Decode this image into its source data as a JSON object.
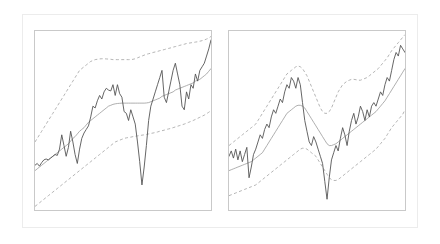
{
  "figure": {
    "background_color": "#ffffff",
    "frame_color": "#ececec",
    "panel_border_color": "#c9c9c9",
    "panel_count": 2
  },
  "colors": {
    "price_line": "#555555",
    "middle_band": "#9a9a9a",
    "outer_bands": "#a8a8a8"
  },
  "chart_data": [
    {
      "type": "line",
      "title": "",
      "subtitle": "",
      "xlabel": "",
      "ylabel": "",
      "xlim": [
        0,
        100
      ],
      "ylim": [
        0,
        100
      ],
      "grid": false,
      "legend": "none",
      "annotations": [],
      "xtick_labels": [],
      "ytick_labels": [],
      "panel_index": 0,
      "panel_name": "left-panel",
      "x": [
        0,
        1.27,
        2.53,
        3.8,
        5.06,
        6.33,
        7.59,
        8.86,
        10.13,
        11.39,
        12.66,
        13.92,
        15.19,
        16.46,
        17.72,
        18.99,
        20.25,
        21.52,
        22.78,
        24.05,
        25.32,
        26.58,
        27.85,
        29.11,
        30.38,
        31.65,
        32.91,
        34.18,
        35.44,
        36.71,
        37.97,
        39.24,
        40.51,
        41.77,
        43.04,
        44.3,
        45.57,
        46.84,
        48.1,
        49.37,
        50.63,
        51.9,
        53.16,
        54.43,
        55.7,
        56.96,
        58.23,
        59.49,
        60.76,
        62.03,
        63.29,
        64.56,
        65.82,
        67.09,
        68.35,
        69.62,
        70.89,
        72.15,
        73.42,
        74.68,
        75.95,
        77.22,
        78.48,
        79.75,
        81.01,
        82.28,
        83.54,
        84.81,
        86.08,
        87.34,
        88.61,
        89.87,
        91.14,
        92.41,
        93.67,
        94.94,
        96.2,
        97.47,
        98.73,
        100
      ],
      "series": [
        {
          "name": "price",
          "style": "solid",
          "color": "#555555",
          "values": [
            25,
            26,
            24.5,
            26.5,
            28,
            28.5,
            28,
            29,
            30,
            31,
            30.5,
            34,
            42,
            36,
            30,
            35,
            44,
            38,
            31,
            26,
            34,
            40,
            43,
            45,
            47,
            52,
            58,
            57,
            61,
            64,
            62,
            66,
            68,
            67,
            66.5,
            70,
            64,
            70,
            65,
            63,
            55,
            54,
            50,
            56,
            52,
            48,
            38,
            27,
            14,
            24,
            36,
            50,
            58,
            62,
            66,
            70,
            74,
            78,
            63,
            60,
            66,
            72,
            78,
            82,
            76,
            70,
            58,
            56,
            66,
            62,
            70,
            68,
            76,
            72,
            78,
            80,
            82,
            86,
            90,
            95
          ]
        },
        {
          "name": "middle band",
          "style": "solid",
          "color": "#9a9a9a",
          "values": [
            22,
            23,
            24,
            25,
            26,
            27,
            28,
            29,
            30,
            31,
            32,
            33,
            34,
            35,
            36,
            37,
            38.5,
            40,
            41,
            42.5,
            44,
            45,
            46,
            47.5,
            49,
            50,
            51,
            52,
            53,
            54,
            55,
            56,
            57,
            58,
            58.5,
            59,
            59.3,
            59.5,
            59.6,
            59.7,
            59.7,
            59.7,
            59.7,
            59.7,
            59.7,
            59.7,
            59.7,
            59.7,
            59.7,
            59.7,
            59.8,
            60,
            60.5,
            61,
            61.5,
            62,
            62.5,
            63.5,
            64,
            64.5,
            65,
            65.5,
            66,
            67,
            67.5,
            68,
            68.5,
            69,
            69.5,
            70,
            70.5,
            71,
            72,
            72.5,
            73,
            74,
            75,
            76,
            77.5,
            79
          ]
        },
        {
          "name": "upper band",
          "style": "dashed",
          "color": "#a8a8a8",
          "values": [
            38,
            40,
            42,
            44,
            46,
            48,
            50,
            52,
            54,
            56,
            58,
            60,
            62,
            64,
            66,
            68,
            70,
            72,
            74,
            76,
            78,
            79,
            80,
            81,
            82,
            83,
            83.5,
            84,
            84.2,
            84.4,
            84.5,
            84.5,
            84.4,
            84.3,
            84.2,
            84,
            84,
            84,
            84,
            84,
            84,
            84,
            84,
            84,
            84.2,
            84.5,
            85,
            85.5,
            86,
            86.5,
            87,
            87.3,
            87.6,
            88,
            88.3,
            88.6,
            89,
            89.3,
            89.6,
            90,
            90.3,
            90.6,
            91,
            91.3,
            91.6,
            92,
            92.3,
            92.6,
            93,
            93.2,
            93.4,
            93.6,
            93.8,
            94,
            94.3,
            94.6,
            95,
            95.5,
            96,
            97
          ]
        },
        {
          "name": "lower band",
          "style": "dashed",
          "color": "#a8a8a8",
          "values": [
            2,
            3,
            4,
            5,
            6,
            7,
            8,
            9,
            10,
            11,
            12,
            13,
            14,
            15,
            16,
            17,
            18,
            19,
            20,
            21,
            22,
            23,
            24,
            25,
            26,
            27,
            28,
            29,
            30,
            31,
            32,
            33,
            34,
            35,
            36,
            37,
            38,
            38.5,
            39,
            39.5,
            40,
            40.3,
            40.5,
            40.7,
            41,
            41.2,
            41.4,
            41.6,
            41.8,
            42,
            42.2,
            42.5,
            42.8,
            43,
            43.3,
            43.6,
            44,
            44.3,
            44.6,
            45,
            45.3,
            45.6,
            46,
            46.4,
            46.8,
            47.2,
            47.6,
            48,
            48.5,
            49,
            49.5,
            50,
            50.6,
            51.2,
            51.8,
            52.4,
            53,
            53.8,
            54.6,
            55.5
          ]
        }
      ]
    },
    {
      "type": "line",
      "title": "",
      "subtitle": "",
      "xlabel": "",
      "ylabel": "",
      "xlim": [
        0,
        100
      ],
      "ylim": [
        0,
        100
      ],
      "grid": false,
      "legend": "none",
      "annotations": [],
      "xtick_labels": [],
      "ytick_labels": [],
      "panel_index": 1,
      "panel_name": "right-panel",
      "x": [
        0,
        1.27,
        2.53,
        3.8,
        5.06,
        6.33,
        7.59,
        8.86,
        10.13,
        11.39,
        12.66,
        13.92,
        15.19,
        16.46,
        17.72,
        18.99,
        20.25,
        21.52,
        22.78,
        24.05,
        25.32,
        26.58,
        27.85,
        29.11,
        30.38,
        31.65,
        32.91,
        34.18,
        35.44,
        36.71,
        37.97,
        39.24,
        40.51,
        41.77,
        43.04,
        44.3,
        45.57,
        46.84,
        48.1,
        49.37,
        50.63,
        51.9,
        53.16,
        54.43,
        55.7,
        56.96,
        58.23,
        59.49,
        60.76,
        62.03,
        63.29,
        64.56,
        65.82,
        67.09,
        68.35,
        69.62,
        70.89,
        72.15,
        73.42,
        74.68,
        75.95,
        77.22,
        78.48,
        79.75,
        81.01,
        82.28,
        83.54,
        84.81,
        86.08,
        87.34,
        88.61,
        89.87,
        91.14,
        92.41,
        93.67,
        94.94,
        96.2,
        97.47,
        98.73,
        100
      ],
      "series": [
        {
          "name": "price",
          "style": "solid",
          "color": "#555555",
          "values": [
            30,
            33,
            29,
            34,
            28,
            33,
            27,
            31,
            35,
            18,
            24,
            31,
            34,
            38,
            42,
            40,
            45,
            48,
            46,
            52,
            56,
            54,
            58,
            62,
            60,
            66,
            70,
            68,
            74,
            72,
            68,
            74,
            70,
            60,
            50,
            44,
            38,
            36,
            41,
            38,
            34,
            30,
            26,
            16,
            6,
            18,
            28,
            32,
            36,
            33,
            40,
            46,
            42,
            36,
            44,
            50,
            54,
            48,
            52,
            58,
            55,
            50,
            56,
            52,
            58,
            60,
            58,
            62,
            66,
            64,
            70,
            74,
            72,
            78,
            84,
            88,
            86,
            92,
            90,
            88
          ]
        },
        {
          "name": "middle band",
          "style": "solid",
          "color": "#9a9a9a",
          "values": [
            22,
            22.5,
            23,
            23.5,
            24,
            24.5,
            25,
            25.5,
            26,
            26.5,
            27,
            28,
            29,
            30,
            31,
            32,
            34,
            36,
            38,
            40,
            42,
            44,
            46,
            48,
            50,
            52,
            54,
            55,
            56,
            57,
            58,
            58.5,
            58.5,
            58,
            57,
            55,
            53,
            51,
            49,
            47,
            45,
            43,
            41,
            39,
            37,
            36,
            36,
            36.5,
            37,
            38,
            39,
            40,
            41,
            42,
            43,
            44,
            45,
            46,
            47,
            48,
            49,
            50,
            51,
            52,
            53,
            54,
            55,
            56.5,
            58,
            59.5,
            61,
            63,
            65,
            67,
            69,
            71,
            73,
            75,
            77,
            79
          ]
        },
        {
          "name": "upper band",
          "style": "dashed",
          "color": "#a8a8a8",
          "values": [
            36,
            37,
            38,
            39,
            40,
            41,
            42,
            43,
            44,
            45,
            46,
            47,
            48,
            50,
            52,
            54,
            56,
            58,
            60,
            62,
            64,
            66,
            68,
            70,
            72,
            74,
            76,
            77,
            78,
            79,
            80,
            80.5,
            80,
            79,
            77,
            75,
            72,
            69,
            66,
            63,
            60,
            57,
            55,
            54,
            54,
            55,
            57,
            60,
            63,
            66,
            68,
            70,
            71,
            72,
            72.5,
            73,
            73,
            72.8,
            72.5,
            72.5,
            73,
            73.5,
            74,
            75,
            76,
            77,
            78,
            79,
            80.5,
            82,
            83.5,
            85,
            87,
            89,
            90.5,
            92,
            93.5,
            95,
            96.5,
            98
          ]
        },
        {
          "name": "lower band",
          "style": "dashed",
          "color": "#a8a8a8",
          "values": [
            8,
            8.5,
            9,
            9.5,
            10,
            10.5,
            11,
            11.5,
            12,
            12.5,
            13,
            13.5,
            14,
            15,
            16,
            17,
            18,
            19,
            20,
            21,
            22,
            23,
            24,
            25,
            26,
            27,
            28,
            29,
            30,
            31,
            32,
            33,
            34,
            34.5,
            34.5,
            34,
            33,
            32,
            31,
            30,
            28,
            26,
            24,
            22,
            20,
            18,
            17,
            16.5,
            16.5,
            17,
            18,
            19,
            20,
            21,
            22,
            23,
            24,
            25,
            26,
            27,
            28,
            29,
            30,
            31,
            32,
            33,
            34,
            35.5,
            37,
            38.5,
            40,
            42,
            44,
            46,
            47.5,
            49,
            50.5,
            52,
            53.5,
            56
          ]
        }
      ]
    }
  ]
}
